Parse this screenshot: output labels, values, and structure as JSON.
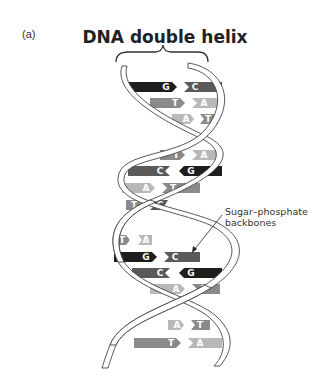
{
  "figure": {
    "panel_label": "(a)",
    "title": "DNA double helix",
    "annotation": {
      "line1": "Sugar–phosphate",
      "line2": "backbones"
    }
  },
  "colors": {
    "G": "#1e1e1e",
    "C": "#5a5a5a",
    "T": "#8a8a8a",
    "A": "#b8b8b8",
    "backbone_stroke": "#444444",
    "backbone_fill": "#ffffff"
  },
  "base_pairs": [
    {
      "left": "G",
      "right": "C"
    },
    {
      "left": "T",
      "right": "A"
    },
    {
      "left": "A",
      "right": "T"
    },
    {
      "left": "T",
      "right": "A"
    },
    {
      "left": "C",
      "right": "G"
    },
    {
      "left": "A",
      "right": "T"
    },
    {
      "left": "T",
      "right": "C"
    },
    {
      "left": "T",
      "right": "A"
    },
    {
      "left": "G",
      "right": "C"
    },
    {
      "left": "C",
      "right": "G"
    },
    {
      "left": "A",
      "right": "T"
    },
    {
      "left": "A",
      "right": "T"
    },
    {
      "left": "T",
      "right": "A"
    }
  ]
}
